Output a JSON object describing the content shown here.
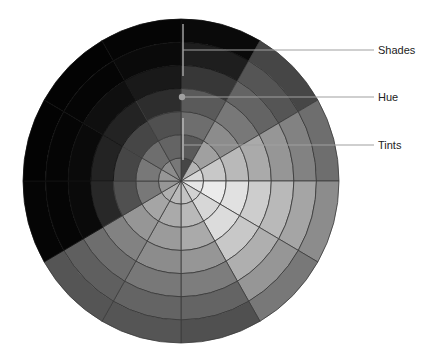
{
  "diagram": {
    "center": [
      181,
      181
    ],
    "radius_x": 158,
    "radius_y": 162,
    "rings": 7,
    "sectors": 12,
    "outline_color": "#3a3a3a",
    "marker_color": "#9a9a9a",
    "sector_grays": [
      [
        70,
        90,
        110,
        90,
        55,
        30,
        10
      ],
      [
        180,
        160,
        140,
        120,
        100,
        85,
        70
      ],
      [
        215,
        200,
        185,
        170,
        150,
        130,
        110
      ],
      [
        230,
        235,
        225,
        205,
        185,
        165,
        140
      ],
      [
        210,
        215,
        220,
        200,
        175,
        150,
        120
      ],
      [
        195,
        185,
        170,
        150,
        125,
        100,
        80
      ],
      [
        185,
        170,
        155,
        140,
        120,
        100,
        85
      ],
      [
        175,
        165,
        150,
        130,
        110,
        95,
        85
      ],
      [
        150,
        120,
        80,
        40,
        10,
        5,
        5
      ],
      [
        150,
        120,
        70,
        35,
        10,
        5,
        3
      ],
      [
        140,
        110,
        70,
        35,
        15,
        5,
        3
      ],
      [
        120,
        100,
        80,
        45,
        25,
        10,
        5
      ]
    ]
  },
  "labels": {
    "shades": "Shades",
    "hue": "Hue",
    "tints": "Tints"
  }
}
